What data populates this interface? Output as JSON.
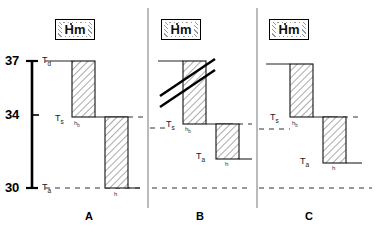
{
  "figure": {
    "type": "thermoregulation-step-diagram",
    "axis": {
      "unit_implied": "degrees C",
      "ticks": [
        {
          "value": "37",
          "y": 61
        },
        {
          "value": "34",
          "y": 115
        },
        {
          "value": "30",
          "y": 188
        }
      ],
      "range": [
        30,
        37
      ]
    },
    "reference_lines": [
      {
        "name": "Td",
        "value": 37,
        "style": "solid"
      },
      {
        "name": "Ta",
        "value": 30,
        "style": "dashed"
      },
      {
        "name": "Ts",
        "value": 34,
        "style": "dashed"
      }
    ],
    "panels": [
      {
        "id": "A",
        "letter": "A",
        "hm_label": "Hm",
        "hm_dot": true,
        "labels": {
          "t_upper": "T",
          "t_upper_sub": "d",
          "t_mid": "T",
          "t_mid_sub": "s",
          "t_lower": "T",
          "t_lower_sub": "a",
          "h_first": "h",
          "h_first_sub": "b",
          "h_second": "h",
          "h_second_sub": ""
        },
        "has_break_lines": false
      },
      {
        "id": "B",
        "letter": "B",
        "hm_label": "Hm",
        "hm_dot": true,
        "labels": {
          "t_upper": "",
          "t_upper_sub": "",
          "t_mid": "T",
          "t_mid_sub": "s",
          "t_lower": "T",
          "t_lower_sub": "a",
          "h_first": "h",
          "h_first_sub": "b",
          "h_second": "h",
          "h_second_sub": ""
        },
        "has_break_lines": true
      },
      {
        "id": "C",
        "letter": "C",
        "hm_label": "Hm",
        "hm_dot": true,
        "labels": {
          "t_upper": "",
          "t_upper_sub": "",
          "t_mid": "T",
          "t_mid_sub": "s",
          "t_lower": "T",
          "t_lower_sub": "a",
          "h_first": "h",
          "h_first_sub": "b",
          "h_second": "h",
          "h_second_sub": ""
        },
        "has_break_lines": false
      }
    ],
    "colors": {
      "ink": "#000000",
      "hatch": "#8c8c8c",
      "divider": "#666666"
    }
  }
}
